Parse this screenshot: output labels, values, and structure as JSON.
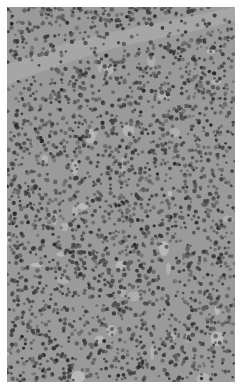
{
  "image": {
    "kind": "grayscale histology micrograph",
    "subject": "densely packed lymphoid cells with a band of fibrous tissue near the top",
    "alt": "Grayscale micrograph of densely packed small round cells (lymphocytes) with a pale fibrous band across the upper portion",
    "colors": {
      "background": "#ffffff",
      "tissue_base": "#9a9a9a",
      "nucleus_dark": "#3a3a3a",
      "nucleus_mid": "#5e5e5e",
      "stroma_light": "#bdbdbd",
      "fiber_band": "#a8a8a8"
    },
    "border_px": {
      "left": 7,
      "top": 7,
      "right": 8,
      "bottom": 8
    },
    "cell_seed": 7,
    "cell_count": 2600
  }
}
